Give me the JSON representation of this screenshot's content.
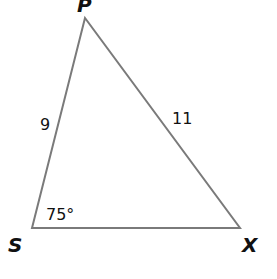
{
  "diagram": {
    "type": "triangle",
    "vertices": {
      "P": {
        "label": "P"
      },
      "S": {
        "label": "S"
      },
      "X": {
        "label": "X"
      }
    },
    "sides": {
      "SP": {
        "label": "9"
      },
      "PX": {
        "label": "11"
      }
    },
    "angles": {
      "S": {
        "label": "75°"
      }
    },
    "colors": {
      "stroke": "#7a7a7a",
      "text": "#111111",
      "background": "#ffffff"
    }
  }
}
